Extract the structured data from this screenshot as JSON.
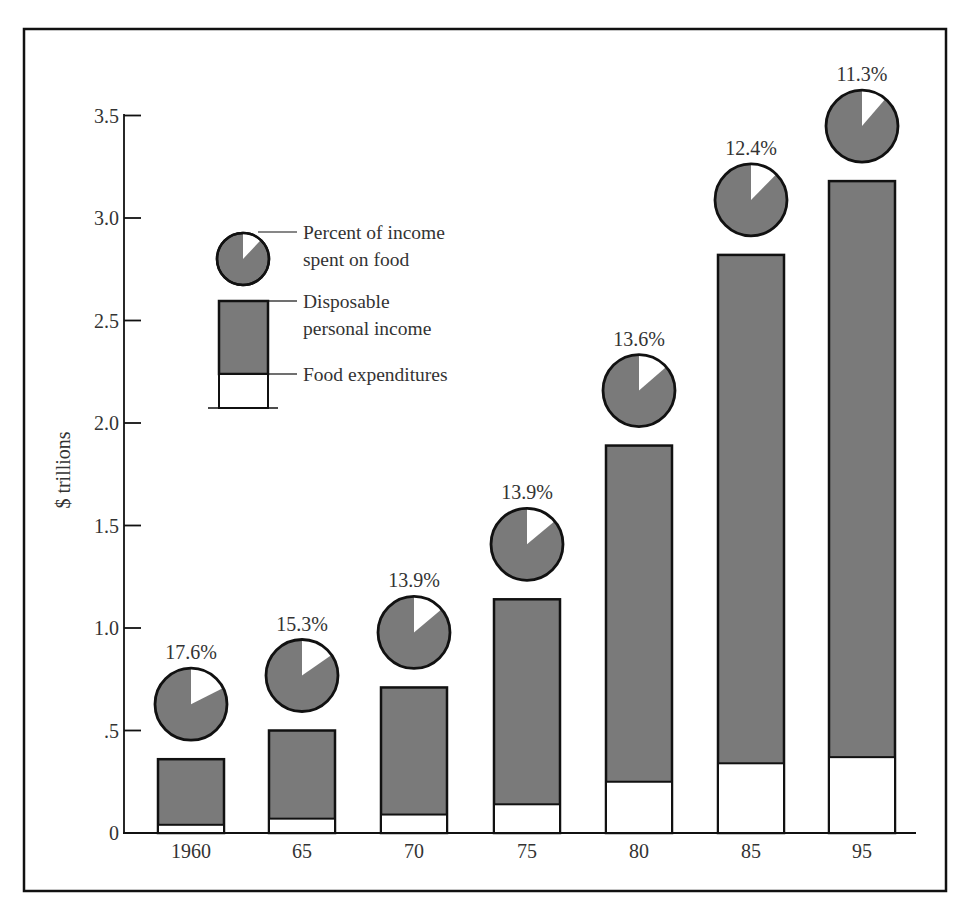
{
  "chart_data": {
    "type": "bar",
    "subtype": "stacked-bar-with-pie-markers",
    "title": "",
    "xlabel": "",
    "ylabel": "$ trillions",
    "ylim": [
      0,
      3.5
    ],
    "yticks": [
      {
        "value": 0,
        "label": "0"
      },
      {
        "value": 0.5,
        "label": ".5"
      },
      {
        "value": 1.0,
        "label": "1.0"
      },
      {
        "value": 1.5,
        "label": "1.5"
      },
      {
        "value": 2.0,
        "label": "2.0"
      },
      {
        "value": 2.5,
        "label": "2.5"
      },
      {
        "value": 3.0,
        "label": "3.0"
      },
      {
        "value": 3.5,
        "label": "3.5"
      }
    ],
    "grid": false,
    "categories": [
      "1960",
      "65",
      "70",
      "75",
      "80",
      "85",
      "95"
    ],
    "series": [
      {
        "name": "Disposable personal income",
        "values": [
          0.36,
          0.5,
          0.71,
          1.14,
          1.89,
          2.82,
          3.18
        ],
        "color": "#7a7a7a"
      },
      {
        "name": "Food expenditures",
        "values": [
          0.04,
          0.07,
          0.09,
          0.14,
          0.25,
          0.34,
          0.37
        ],
        "color": "#ffffff"
      },
      {
        "name": "Percent of income spent on food",
        "values": [
          17.6,
          15.3,
          13.9,
          13.9,
          13.6,
          12.4,
          11.3
        ],
        "labels": [
          "17.6%",
          "15.3%",
          "13.9%",
          "13.9%",
          "13.6%",
          "12.4%",
          "11.3%"
        ]
      }
    ],
    "legend": {
      "position": "upper-left-inside",
      "entries": [
        {
          "label_line1": "Percent of income",
          "label_line2": "spent on food",
          "symbol": "pie"
        },
        {
          "label_line1": "Disposable",
          "label_line2": "personal income",
          "symbol": "gray-bar"
        },
        {
          "label_line1": "Food expenditures",
          "label_line2": "",
          "symbol": "white-bar"
        }
      ]
    }
  },
  "colors": {
    "bar_fill": "#7a7a7a",
    "food_fill": "#ffffff",
    "stroke": "#111111",
    "text": "#333333"
  }
}
